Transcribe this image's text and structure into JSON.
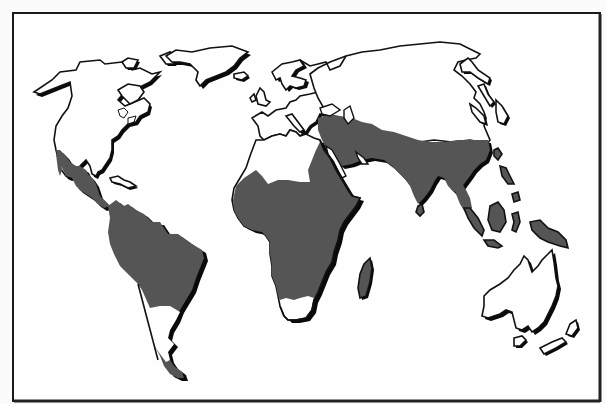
{
  "map": {
    "type": "world-map",
    "style": "monochrome outline with shaded regions",
    "colors": {
      "background": "#fbfbfb",
      "land": "#fefefe",
      "outline": "#111111",
      "shadow": "#0a0a0a",
      "shaded_region": "#555555",
      "frame": "#1a1a1a"
    },
    "continents": [
      {
        "name": "North America",
        "shaded": "partial (Mexico / Central America)"
      },
      {
        "name": "Greenland",
        "shaded": "none"
      },
      {
        "name": "South America",
        "shaded": "most, except southern cone"
      },
      {
        "name": "Europe",
        "shaded": "none"
      },
      {
        "name": "Africa",
        "shaded": "most, except north and southern tip"
      },
      {
        "name": "Madagascar",
        "shaded": "all"
      },
      {
        "name": "Asia",
        "shaded": "southern band (Middle East, South and Southeast Asia)"
      },
      {
        "name": "Indonesia / Philippines / New Guinea",
        "shaded": "all"
      },
      {
        "name": "Japan",
        "shaded": "none"
      },
      {
        "name": "Australia",
        "shaded": "none"
      },
      {
        "name": "New Zealand",
        "shaded": "none"
      },
      {
        "name": "Tasmania",
        "shaded": "none"
      }
    ]
  }
}
